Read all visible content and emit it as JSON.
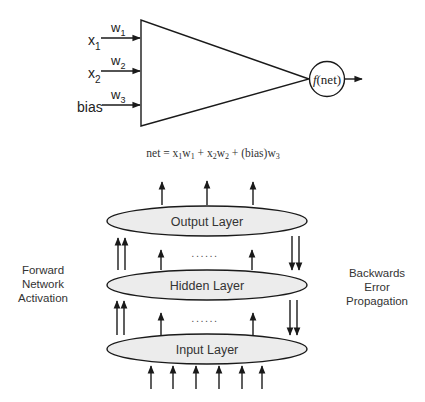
{
  "perceptron": {
    "inputs": [
      {
        "label": "x",
        "sub": "1",
        "weight": "w",
        "weight_sub": "1"
      },
      {
        "label": "x",
        "sub": "2",
        "weight": "w",
        "weight_sub": "2"
      },
      {
        "label": "bias",
        "sub": "",
        "weight": "w",
        "weight_sub": "3"
      }
    ],
    "activation_f": "f",
    "activation_arg": "(net)",
    "equation": {
      "lhs": "net = x",
      "t1_sub1": "1",
      "t1_w": "w",
      "t1_sub2": "1",
      "plus1": " + x",
      "t2_sub1": "2",
      "t2_w": "w",
      "t2_sub2": "2",
      "plus2": " + (bias)w",
      "t3_sub": "3"
    }
  },
  "network": {
    "layers": [
      {
        "name": "Output Layer"
      },
      {
        "name": "Hidden Layer"
      },
      {
        "name": "Input Layer"
      }
    ],
    "ellipsis": "......",
    "left_caption": [
      "Forward",
      "Network",
      "Activation"
    ],
    "right_caption": [
      "Backwards",
      "Error",
      "Propagation"
    ]
  },
  "colors": {
    "stroke": "#1a1a1a",
    "ellipse_fill": "#ececec",
    "text": "#333333"
  }
}
